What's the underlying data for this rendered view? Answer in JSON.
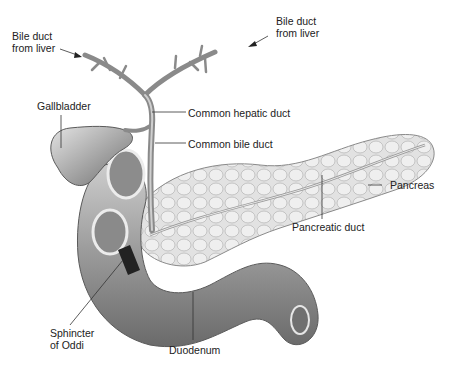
{
  "diagram": {
    "labels": {
      "bile_duct_left": [
        "Bile duct",
        "from liver"
      ],
      "bile_duct_right": [
        "Bile duct",
        "from liver"
      ],
      "gallbladder": "Gallbladder",
      "common_hepatic_duct": "Common hepatic duct",
      "common_bile_duct": "Common bile duct",
      "pancreas": "Pancreas",
      "pancreatic_duct": "Pancreatic duct",
      "sphincter_of_oddi": [
        "Sphincter",
        "of Oddi"
      ],
      "duodenum": "Duodenum"
    },
    "colors": {
      "background": "#ffffff",
      "organ_dark": "#6e6e6e",
      "organ_mid": "#a8a8a8",
      "organ_light": "#dcdcdc",
      "leader_line": "#333333"
    }
  }
}
